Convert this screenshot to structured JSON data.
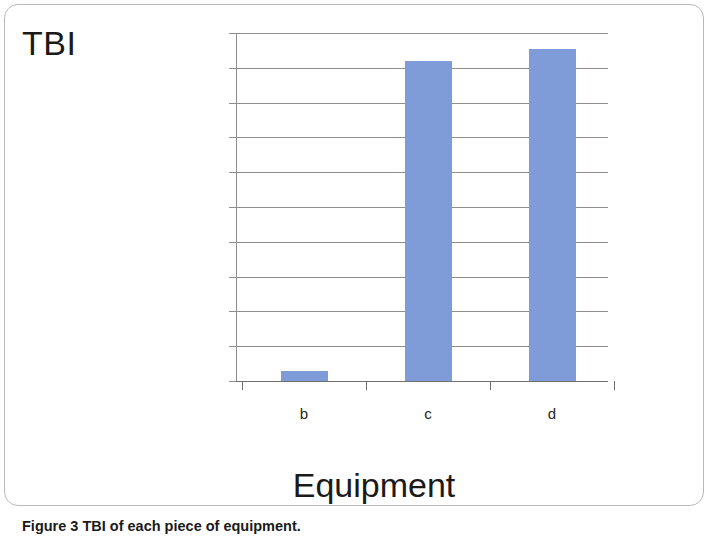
{
  "figure": {
    "caption_label": "Figure 3",
    "caption_text": "TBI of each piece of equipment.",
    "frame_color": "#b9b9b9"
  },
  "chart_data": {
    "type": "bar",
    "title": "TBI",
    "subtitle": "",
    "xlabel": "Equipment",
    "ylabel": "",
    "categories": [
      "b",
      "c",
      "d"
    ],
    "values": [
      28,
      920,
      955
    ],
    "series": [
      {
        "name": "TBI",
        "values": [
          28,
          920,
          955
        ],
        "color": "#7f9cd8"
      }
    ],
    "ylim": [
      0,
      1000
    ],
    "ytick_labels": [
      "1000",
      "900",
      "800",
      "700",
      "600",
      "500",
      "400",
      "300",
      "200",
      "100",
      "0"
    ],
    "ytick_values": [
      1000,
      900,
      800,
      700,
      600,
      500,
      400,
      300,
      200,
      100,
      0
    ],
    "grid": true,
    "grid_axis": "y",
    "legend": false,
    "legend_position": "none",
    "bar_color": "#7f9cd8",
    "axis_color": "#8d8d8d"
  }
}
